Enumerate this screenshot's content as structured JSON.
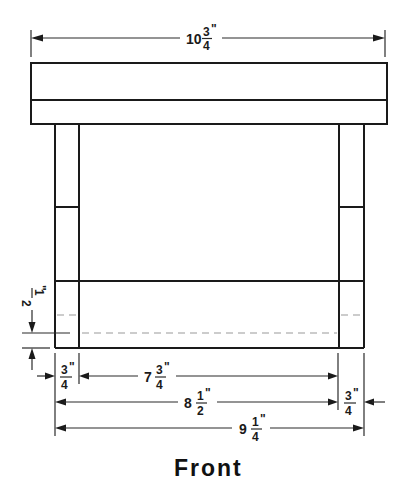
{
  "title": "Front",
  "colors": {
    "line": "#1a1a1a",
    "hidden_line": "#9a9a9a",
    "background": "#ffffff"
  },
  "dimensions": {
    "overall_top_width": {
      "whole": "10",
      "num": "3",
      "den": "4",
      "unit": "\""
    },
    "leg_rail_offset": {
      "whole": "",
      "num": "1",
      "den": "2",
      "unit": "\""
    },
    "left_leg_width": {
      "whole": "",
      "num": "3",
      "den": "4",
      "unit": "\""
    },
    "apron_inner_width": {
      "whole": "7",
      "num": "3",
      "den": "4",
      "unit": "\""
    },
    "leg_to_leg_width": {
      "whole": "8",
      "num": "1",
      "den": "2",
      "unit": "\""
    },
    "right_leg_width": {
      "whole": "",
      "num": "3",
      "den": "4",
      "unit": "\""
    },
    "overall_base_width": {
      "whole": "9",
      "num": "1",
      "den": "4",
      "unit": "\""
    }
  }
}
